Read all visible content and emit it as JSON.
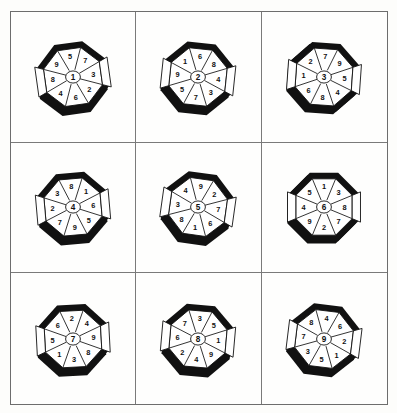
{
  "figure": {
    "title": "",
    "background_color": "#fdfdfb",
    "frame_color": "#6d6d6d",
    "grid_line_color": "#7a7a7a",
    "ink_color": "#111111",
    "rows": 3,
    "columns": 3
  },
  "cells": [
    {
      "id": "cell-1",
      "row": 1,
      "column": 1,
      "center": "1",
      "rotation": -8,
      "shadow_angle": 200,
      "segments": [
        "5",
        "7",
        "3",
        "2",
        "6",
        "4",
        "8",
        "9"
      ]
    },
    {
      "id": "cell-2",
      "row": 1,
      "column": 2,
      "center": "2",
      "rotation": 6,
      "shadow_angle": 215,
      "segments": [
        "6",
        "8",
        "4",
        "3",
        "7",
        "5",
        "9",
        "1"
      ]
    },
    {
      "id": "cell-3",
      "row": 1,
      "column": 3,
      "center": "3",
      "rotation": 4,
      "shadow_angle": 230,
      "segments": [
        "7",
        "9",
        "5",
        "4",
        "8",
        "6",
        "1",
        "2"
      ]
    },
    {
      "id": "cell-4",
      "row": 2,
      "column": 1,
      "center": "4",
      "rotation": -5,
      "shadow_angle": 195,
      "segments": [
        "8",
        "1",
        "6",
        "5",
        "9",
        "7",
        "2",
        "3"
      ]
    },
    {
      "id": "cell-5",
      "row": 2,
      "column": 2,
      "center": "5",
      "rotation": 8,
      "shadow_angle": 205,
      "segments": [
        "9",
        "2",
        "7",
        "6",
        "1",
        "8",
        "3",
        "4"
      ]
    },
    {
      "id": "cell-6",
      "row": 2,
      "column": 3,
      "center": "6",
      "rotation": 0,
      "shadow_angle": 225,
      "segments": [
        "1",
        "3",
        "8",
        "7",
        "2",
        "9",
        "4",
        "5"
      ]
    },
    {
      "id": "cell-7",
      "row": 3,
      "column": 1,
      "center": "7",
      "rotation": -3,
      "shadow_angle": 210,
      "segments": [
        "2",
        "4",
        "9",
        "8",
        "3",
        "1",
        "5",
        "6"
      ]
    },
    {
      "id": "cell-8",
      "row": 3,
      "column": 2,
      "center": "8",
      "rotation": 5,
      "shadow_angle": 200,
      "segments": [
        "3",
        "5",
        "1",
        "9",
        "4",
        "2",
        "6",
        "7"
      ]
    },
    {
      "id": "cell-9",
      "row": 3,
      "column": 3,
      "center": "9",
      "rotation": 7,
      "shadow_angle": 220,
      "segments": [
        "4",
        "6",
        "2",
        "1",
        "5",
        "3",
        "7",
        "8"
      ]
    }
  ]
}
